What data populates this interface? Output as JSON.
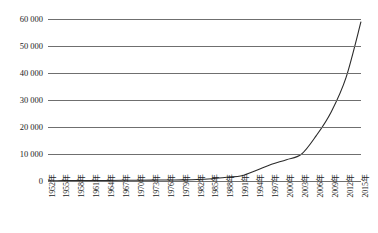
{
  "title_fragment": "",
  "chart_data": {
    "type": "line",
    "title": "",
    "subtitle": "",
    "xlabel": "",
    "ylabel": "",
    "grid": true,
    "legend": "none",
    "ylim": [
      0,
      60000
    ],
    "yticks": [
      0,
      10000,
      20000,
      30000,
      40000,
      50000,
      60000
    ],
    "ytick_labels": [
      "0",
      "10 000",
      "20 000",
      "30 000",
      "40 000",
      "50 000",
      "60 000"
    ],
    "xlim": [
      1952,
      2015
    ],
    "xtick_labels": [
      "1952年",
      "1955年",
      "1958年",
      "1961年",
      "1964年",
      "1967年",
      "1970年",
      "1973年",
      "1976年",
      "1979年",
      "1982年",
      "1985年",
      "1988年",
      "1991年",
      "1994年",
      "1997年",
      "2000年",
      "2003年",
      "2006年",
      "2009年",
      "2012年",
      "2015年"
    ],
    "line_color": "#2b2b2b",
    "grid_color": "#6f6f6f",
    "series": [
      {
        "name": "series-1",
        "x": [
          1952,
          1955,
          1958,
          1961,
          1964,
          1967,
          1970,
          1973,
          1976,
          1979,
          1982,
          1985,
          1988,
          1991,
          1994,
          1997,
          2000,
          2003,
          2006,
          2009,
          2012,
          2015
        ],
        "values": [
          80,
          130,
          180,
          160,
          210,
          250,
          290,
          330,
          380,
          420,
          530,
          860,
          1400,
          1950,
          4000,
          6200,
          7900,
          9900,
          16800,
          25600,
          38400,
          59000
        ]
      }
    ]
  }
}
